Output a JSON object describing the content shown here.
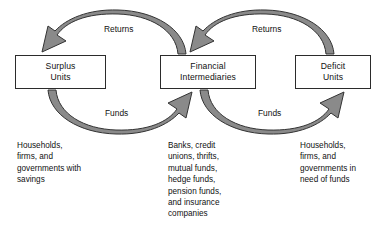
{
  "diagram": {
    "type": "flow-diagram",
    "colors": {
      "arrow_fill": "#8a8a8a",
      "arrow_stroke": "#333333",
      "box_border": "#2b2b2b",
      "text": "#111111",
      "background": "#ffffff"
    }
  },
  "boxes": [
    {
      "id": "surplus-units",
      "line1": "Surplus",
      "line2": "Units"
    },
    {
      "id": "financial-intermediaries",
      "line1": "Financial",
      "line2": "Intermediaries"
    },
    {
      "id": "deficit-units",
      "line1": "Deficit",
      "line2": "Units"
    }
  ],
  "flows": [
    {
      "id": "returns-left",
      "label": "Returns",
      "from": "financial-intermediaries",
      "to": "surplus-units",
      "direction": "left",
      "position": "top"
    },
    {
      "id": "returns-right",
      "label": "Returns",
      "from": "deficit-units",
      "to": "financial-intermediaries",
      "direction": "left",
      "position": "top"
    },
    {
      "id": "funds-left",
      "label": "Funds",
      "from": "surplus-units",
      "to": "financial-intermediaries",
      "direction": "right",
      "position": "bottom"
    },
    {
      "id": "funds-right",
      "label": "Funds",
      "from": "financial-intermediaries",
      "to": "deficit-units",
      "direction": "right",
      "position": "bottom"
    }
  ],
  "captions": [
    {
      "id": "surplus-units-caption",
      "lines": [
        "Households,",
        "firms, and",
        "governments with",
        "savings"
      ]
    },
    {
      "id": "financial-intermediaries-caption",
      "lines": [
        "Banks, credit",
        "unions, thrifts,",
        "mutual funds,",
        "hedge funds,",
        "pension funds,",
        "and insurance",
        "companies"
      ]
    },
    {
      "id": "deficit-units-caption",
      "lines": [
        "Households,",
        "firms, and",
        "governments in",
        "need of funds"
      ]
    }
  ]
}
